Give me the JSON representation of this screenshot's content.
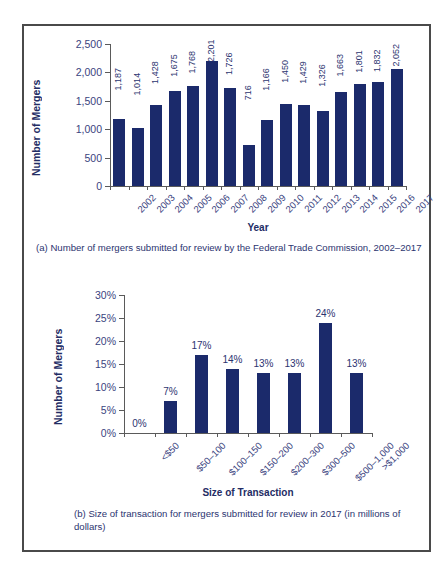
{
  "figure": {
    "border_color": "#4a4a4a",
    "background": "#ffffff"
  },
  "panel_a": {
    "caption": "(a) Number of mergers submitted for review by the Federal Trade Commission, 2002–2017",
    "y_axis_title": "Number of Mergers",
    "x_axis_title": "Year"
  },
  "panel_b": {
    "caption": "(b) Size of transaction for mergers submitted for review in 2017 (in millions of dollars)",
    "y_axis_title": "Number of Mergers",
    "x_axis_title": "Size of Transaction"
  },
  "chart_data": [
    {
      "id": "panel-a",
      "type": "bar",
      "title": "",
      "xlabel": "Year",
      "ylabel": "Number of Mergers",
      "ylim": [
        0,
        2500
      ],
      "yticks": [
        0,
        500,
        1000,
        1500,
        2000,
        2500
      ],
      "ytick_labels": [
        "0",
        "500",
        "1,000",
        "1,500",
        "2,000",
        "2,500"
      ],
      "grid": false,
      "legend": "none",
      "bar_color": "#1b2a6b",
      "categories": [
        "2002",
        "2003",
        "2004",
        "2005",
        "2006",
        "2007",
        "2008",
        "2009",
        "2010",
        "2011",
        "2012",
        "2013",
        "2014",
        "2015",
        "2016",
        "2017"
      ],
      "values": [
        1187,
        1014,
        1428,
        1675,
        1768,
        2201,
        1726,
        716,
        1166,
        1450,
        1429,
        1326,
        1663,
        1801,
        1832,
        2052
      ],
      "data_labels": [
        "1,187",
        "1,014",
        "1,428",
        "1,675",
        "1,768",
        "2,201",
        "1,726",
        "716",
        "1,166",
        "1,450",
        "1,429",
        "1,326",
        "1,663",
        "1,801",
        "1,832",
        "2,052"
      ]
    },
    {
      "id": "panel-b",
      "type": "bar",
      "title": "",
      "xlabel": "Size of Transaction",
      "ylabel": "Number of Mergers",
      "ylim": [
        0,
        30
      ],
      "yticks": [
        0,
        5,
        10,
        15,
        20,
        25,
        30
      ],
      "ytick_labels": [
        "0%",
        "5%",
        "10%",
        "15%",
        "20%",
        "25%",
        "30%"
      ],
      "grid": false,
      "legend": "none",
      "bar_color": "#1b2a6b",
      "categories": [
        "<$50",
        "$50–100",
        "$100–150",
        "$150–200",
        "$200–300",
        "$300–500",
        "$500–1,000",
        ">$1,000"
      ],
      "values": [
        0,
        7,
        17,
        14,
        13,
        13,
        24,
        13
      ],
      "data_labels": [
        "0%",
        "7%",
        "17%",
        "14%",
        "13%",
        "13%",
        "24%",
        "13%"
      ]
    }
  ]
}
